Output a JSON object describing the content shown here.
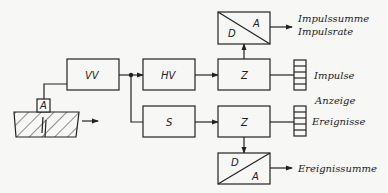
{
  "diagram": {
    "type": "block-diagram",
    "blocks": {
      "vv": "VV",
      "hv": "HV",
      "s": "S",
      "z_top": "Z",
      "z_bottom": "Z",
      "sensor": "A",
      "da_top": {
        "d": "D",
        "a": "A"
      },
      "da_bottom": {
        "d": "D",
        "a": "A"
      }
    },
    "outputs": {
      "impulssumme": "Impulssumme",
      "impulsrate": "Impulsrate",
      "impulse": "Impulse",
      "anzeige": "Anzeige",
      "ereignisse": "Ereignisse",
      "ereignissumme": "Ereignissumme"
    },
    "colors": {
      "stroke": "#222222",
      "background": "#f7f7f5"
    }
  }
}
